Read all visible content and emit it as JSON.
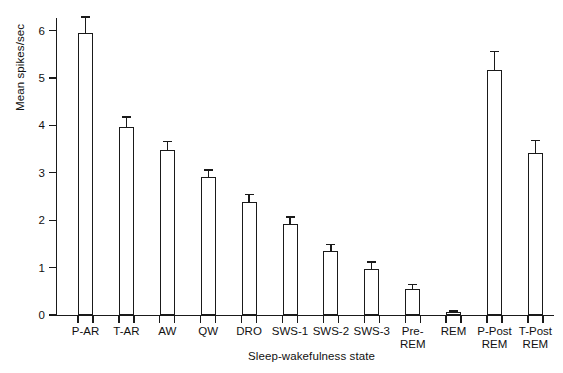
{
  "chart_data": {
    "type": "bar",
    "title": "",
    "subtitle": "",
    "xlabel": "Sleep-wakefulness state",
    "ylabel": "Mean spikes/sec",
    "categories": [
      "P-AR",
      "T-AR",
      "AW",
      "QW",
      "DRO",
      "SWS-1",
      "SWS-2",
      "SWS-3",
      "Pre-\nREM",
      "REM",
      "P-Post\nREM",
      "T-Post\nREM"
    ],
    "values": [
      5.95,
      3.97,
      3.48,
      2.92,
      2.38,
      1.93,
      1.35,
      0.96,
      0.55,
      0.07,
      5.16,
      3.42
    ],
    "errors": [
      0.35,
      0.22,
      0.2,
      0.15,
      0.17,
      0.15,
      0.15,
      0.17,
      0.1,
      0.03,
      0.42,
      0.28
    ],
    "error_type": "SEM",
    "ylim": [
      0,
      6.3
    ],
    "yticks": [
      0,
      1,
      2,
      3,
      4,
      5,
      6
    ],
    "ytick_labels": [
      "0",
      "1",
      "2",
      "3",
      "4",
      "5",
      "6"
    ],
    "grid": false,
    "legend": "none",
    "bar_fill": "#ffffff",
    "bar_edge": "#1a1a1a",
    "axis_color": "#1a1a1a"
  },
  "axis": {
    "y_title": "Mean spikes/sec",
    "x_title": "Sleep-wakefulness state"
  }
}
